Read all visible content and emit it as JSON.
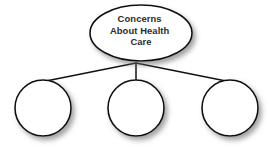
{
  "diagram": {
    "type": "concept-map",
    "background_color": "#ffffff",
    "stroke_color": "#111111",
    "text_color": "#2b2b2b",
    "center_node": {
      "shape": "ellipse",
      "label_lines": [
        "Concerns",
        "About Health",
        "Care"
      ],
      "label_full": "Concerns About Health Care",
      "cx": 141,
      "cy": 33,
      "rx": 51,
      "ry": 28
    },
    "child_nodes": [
      {
        "shape": "circle",
        "label": "",
        "cx": 43,
        "cy": 108,
        "r": 28
      },
      {
        "shape": "circle",
        "label": "",
        "cx": 136,
        "cy": 108,
        "r": 28
      },
      {
        "shape": "circle",
        "label": "",
        "cx": 230,
        "cy": 108,
        "r": 28
      }
    ],
    "connectors": [
      {
        "from": "center-node",
        "to": "child-node-1",
        "x1": 136,
        "y1": 63,
        "x2": 46,
        "y2": 81
      },
      {
        "from": "center-node",
        "to": "child-node-2",
        "x1": 136,
        "y1": 63,
        "x2": 136,
        "y2": 80
      },
      {
        "from": "center-node",
        "to": "child-node-3",
        "x1": 136,
        "y1": 63,
        "x2": 226,
        "y2": 81
      }
    ]
  }
}
